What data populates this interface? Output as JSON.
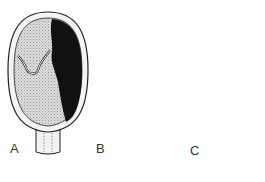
{
  "figure": {
    "panels": [
      {
        "label": "A",
        "stage": "concealed hemorrhage behind placenta"
      },
      {
        "label": "B",
        "stage": "hemorrhage with external bleeding through cervix"
      },
      {
        "label": "C",
        "stage": "hemorrhage with fetus shown, external bleeding"
      }
    ],
    "colors": {
      "outline": "#222222",
      "blood": "#111111",
      "placenta_fill": "#d8d8d8",
      "wall": "#f4f4f4"
    }
  }
}
